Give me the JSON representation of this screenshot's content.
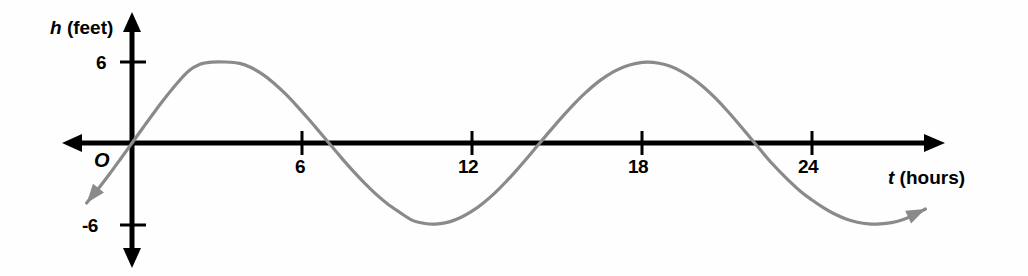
{
  "figure": {
    "origin_label": "O",
    "y_axis_title_var": "h",
    "y_axis_title_unit": "(feet)",
    "x_axis_title_var": "t",
    "x_axis_title_unit": "(hours)",
    "curve_color": "#8a8a8a",
    "axis_color": "#000000"
  },
  "chart_data": {
    "type": "line",
    "title": "",
    "subtitle": "",
    "xlabel": "t (hours)",
    "ylabel": "h (feet)",
    "xlim": [
      -1.6,
      28.7
    ],
    "ylim": [
      -9.6,
      6.9
    ],
    "grid": false,
    "legend": null,
    "x_ticks": [
      6,
      12,
      18,
      24
    ],
    "x_tick_labels": [
      "6",
      "12",
      "18",
      "24"
    ],
    "y_ticks": [
      6,
      -6
    ],
    "y_tick_labels": [
      "6",
      "-6"
    ],
    "annotations": [
      "O"
    ],
    "series": [
      {
        "name": "tide height",
        "function": "h = 6 sin(2*pi*t/13.2)",
        "amplitude": 6,
        "period": 13.2,
        "phase": 0,
        "midline": 0,
        "arrow_start": true,
        "arrow_end": true,
        "key_points": [
          {
            "t": 0,
            "h": 0
          },
          {
            "t": 3.3,
            "h": 6
          },
          {
            "t": 6.6,
            "h": 0
          },
          {
            "t": 9.9,
            "h": -6
          },
          {
            "t": 13.2,
            "h": 0
          },
          {
            "t": 16.5,
            "h": 6
          },
          {
            "t": 19.8,
            "h": 0
          },
          {
            "t": 23.1,
            "h": -6
          },
          {
            "t": 26.4,
            "h": 0
          }
        ],
        "x": [
          -1.6,
          -1.2,
          -0.8,
          -0.4,
          0,
          0.4,
          0.8,
          1.2,
          1.6,
          2,
          2.4,
          2.8,
          3.3,
          3.8,
          4.2,
          4.6,
          5,
          5.4,
          5.8,
          6.2,
          6.6,
          7,
          7.4,
          7.8,
          8.2,
          8.6,
          9,
          9.4,
          9.9,
          10.4,
          10.8,
          11.2,
          11.6,
          12,
          12.4,
          12.8,
          13.2,
          13.6,
          14,
          14.4,
          14.8,
          15.2,
          15.6,
          16,
          16.5,
          17,
          17.4,
          17.8,
          18.2,
          18.6,
          19,
          19.4,
          19.8,
          20.2,
          20.6,
          21,
          21.4,
          21.8,
          22.2,
          22.6,
          23.1,
          23.6,
          24,
          24.4,
          24.8,
          25.2,
          25.6,
          26,
          26.4,
          26.8,
          27.2,
          27.6,
          28
        ],
        "y": [
          -4.44,
          -3.42,
          -2.32,
          -1.17,
          0,
          1.17,
          2.32,
          3.42,
          4.44,
          5.33,
          5.83,
          5.99,
          6,
          5.9,
          5.59,
          5.1,
          4.45,
          3.67,
          2.79,
          1.85,
          0.87,
          -0.13,
          -1.12,
          -2.07,
          -2.96,
          -3.77,
          -4.48,
          -5.07,
          -5.73,
          -5.98,
          -5.99,
          -5.84,
          -5.52,
          -5.05,
          -4.44,
          -3.71,
          -2.87,
          -1.95,
          -0.98,
          0.02,
          1.01,
          1.97,
          2.88,
          3.71,
          4.6,
          5.28,
          5.67,
          5.9,
          5.99,
          5.91,
          5.68,
          5.29,
          4.76,
          4.09,
          3.3,
          2.41,
          1.45,
          0.45,
          -0.56,
          -1.54,
          -2.62,
          -3.59,
          -4.22,
          -4.78,
          -5.26,
          -5.63,
          -5.87,
          -5.99,
          -5.99,
          -5.9,
          -5.68,
          -5.34,
          -4.89
        ]
      }
    ]
  }
}
